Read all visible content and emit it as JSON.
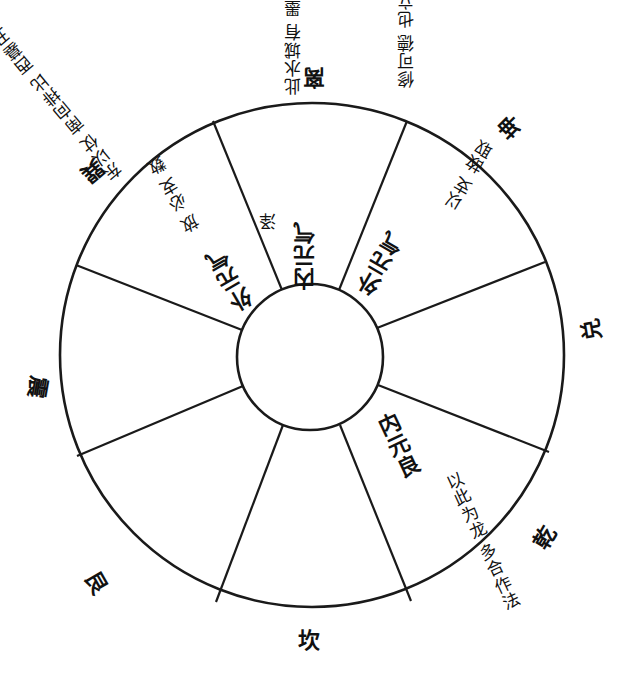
{
  "diagram": {
    "type": "eight-trigram wheel (rotated scan)",
    "outer_circle": {
      "cx": 312,
      "cy": 355,
      "r": 252
    },
    "inner_circle": {
      "cx": 310,
      "cy": 357,
      "r": 73
    },
    "stroke_color": "#1a1a1a",
    "background": "#ffffff",
    "sectors": 8
  },
  "trigrams": {
    "top": "离",
    "top_right": "坤",
    "right": "兑",
    "bottom_right": "乾",
    "bottom": "坎",
    "bottom_left": "艮",
    "left": "震",
    "top_left": "巽"
  },
  "outer_notes": {
    "li_left": [
      "此水城有",
      "墨则门以",
      "东合收放"
    ],
    "li_right": [
      "修可德",
      "也立仗",
      "西久"
    ],
    "xun": [
      "巽",
      "东以仗",
      "南向排比",
      "西墓丑",
      "四"
    ]
  },
  "sector_texts": {
    "top_center": {
      "head": "内元气",
      "note": "泽"
    },
    "top_right": {
      "head": "外元气",
      "note": [
        "以支",
        "故取"
      ]
    },
    "top_left": {
      "head": "外元气",
      "note": [
        "放",
        "必支",
        "数"
      ]
    },
    "bottom_right": {
      "head": "内元良",
      "note": [
        "以此为龙",
        "多合作法"
      ]
    }
  }
}
